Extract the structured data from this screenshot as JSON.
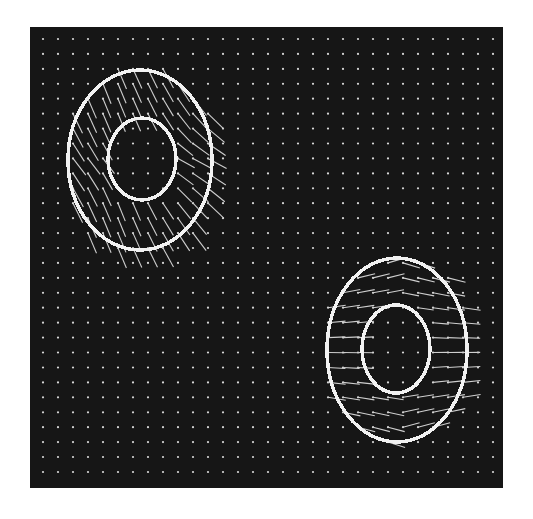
{
  "figure": {
    "type": "needle-map",
    "background_color": "#ffffff",
    "panel": {
      "x": 30,
      "y": 27,
      "width": 473,
      "height": 461,
      "color": "#161616"
    },
    "grid": {
      "x0": 43,
      "y0": 39,
      "dx": 15,
      "dy": 14.93,
      "cols": 31,
      "rows": 30,
      "dot_color": "#d8d8d8",
      "dot_radius": 1.1
    },
    "ellipses": [
      {
        "name": "object-1-outer-boundary",
        "cx": 140,
        "cy": 160,
        "rx": 72,
        "ry": 90,
        "stroke": "#f2f2f2",
        "stroke_width": 3.5
      },
      {
        "name": "object-1-inner-boundary",
        "cx": 142,
        "cy": 159,
        "rx": 34,
        "ry": 41,
        "stroke": "#f2f2f2",
        "stroke_width": 3.5
      },
      {
        "name": "object-2-outer-boundary",
        "cx": 397,
        "cy": 350,
        "rx": 70,
        "ry": 92,
        "stroke": "#f2f2f2",
        "stroke_width": 3.5
      },
      {
        "name": "object-2-inner-boundary",
        "cx": 396,
        "cy": 349,
        "rx": 34,
        "ry": 44,
        "stroke": "#f2f2f2",
        "stroke_width": 3.5
      }
    ],
    "needle_fields": [
      {
        "name": "object-1-needles",
        "region": {
          "cx": 140,
          "cy": 160,
          "rx": 80,
          "ry": 98,
          "hole_rx": 34,
          "hole_ry": 41
        },
        "mode": "tilted",
        "base_angle_deg": 40,
        "radial_gain": 0.55,
        "length": 22,
        "color": "#cfcfcf"
      },
      {
        "name": "object-2-needles",
        "region": {
          "cx": 397,
          "cy": 350,
          "rx": 80,
          "ry": 94,
          "hole_rx": 34,
          "hole_ry": 44
        },
        "mode": "horizontal",
        "base_angle_deg": 0,
        "radial_gain": 0.35,
        "length": 18,
        "color": "#cfcfcf"
      }
    ]
  }
}
